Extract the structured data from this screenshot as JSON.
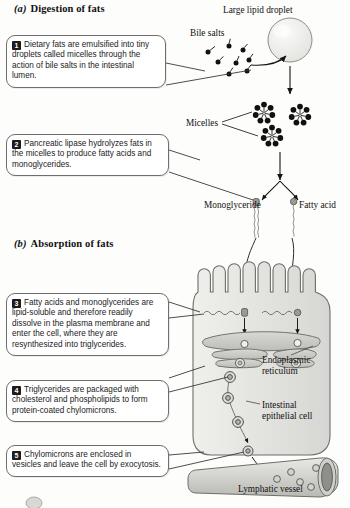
{
  "figure": {
    "sections": [
      {
        "id": "a",
        "letter": "(a)",
        "title": "Digestion of fats"
      },
      {
        "id": "b",
        "letter": "(b)",
        "title": "Absorption of fats"
      }
    ]
  },
  "steps": [
    {
      "number": "1",
      "text": "Dietary fats are emulsified into tiny droplets called micelles through the action of bile salts in the intestinal lumen."
    },
    {
      "number": "2",
      "text": "Pancreatic lipase hydrolyzes fats in the micelles to produce fatty acids and monoglycerides."
    },
    {
      "number": "3",
      "text": "Fatty acids and monoglycerides are lipid-soluble and therefore readily dissolve in the plasma membrane and enter the cell, where they are resynthesized into triglycerides."
    },
    {
      "number": "4",
      "text": "Triglycerides are packaged with cholesterol and phospholipids to form protein-coated chylomicrons."
    },
    {
      "number": "5",
      "text": "Chylomicrons are enclosed in vesicles and leave the cell by exocytosis."
    }
  ],
  "labels": {
    "large_lipid_droplet": "Large lipid droplet",
    "bile_salts": "Bile salts",
    "micelles": "Micelles",
    "monoglyceride": "Monoglyceride",
    "fatty_acid": "Fatty acid",
    "endoplasmic_reticulum": "Endoplasmic reticulum",
    "intestinal_epithelial_cell": "Intestinal epithelial cell",
    "lymphatic_vessel": "Lymphatic vessel"
  },
  "colors": {
    "background": "#fdfdfc",
    "ink": "#1a1a1a",
    "callout_border": "#6e6e6e",
    "badge_fill": "#1b1b1b",
    "lipid_droplet_fill": "#ededea",
    "cell_fill": "#e6e6e3",
    "cell_stroke": "#6d6d6a",
    "er_fill": "#c9c9c5",
    "vessel_fill": "#d4d4d0",
    "vessel_lumen": "#8e8e8a",
    "micelle_dot": "#111111"
  }
}
